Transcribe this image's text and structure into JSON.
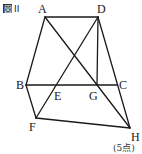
{
  "figure": {
    "label_box": "図",
    "label_num": "II",
    "points_note": "(5点)"
  },
  "points": {
    "A": {
      "label": "A",
      "x": 45,
      "y": 17
    },
    "D": {
      "label": "D",
      "x": 98,
      "y": 17
    },
    "B": {
      "label": "B",
      "x": 26,
      "y": 85
    },
    "E": {
      "label": "E",
      "x": 56,
      "y": 85
    },
    "G": {
      "label": "G",
      "x": 97,
      "y": 85
    },
    "C": {
      "label": "C",
      "x": 117,
      "y": 85
    },
    "F": {
      "label": "F",
      "x": 36,
      "y": 118
    },
    "H": {
      "label": "H",
      "x": 130,
      "y": 128
    }
  },
  "segments": [
    "AD",
    "AB",
    "DC",
    "BC",
    "AH",
    "DF",
    "DG",
    "BF",
    "FH",
    "CH"
  ],
  "colors": {
    "stroke": "#1a1a1a",
    "background": "#ffffff"
  }
}
